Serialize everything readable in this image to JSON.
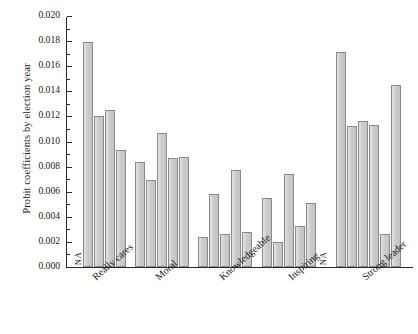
{
  "chart_data": {
    "type": "bar",
    "title": "",
    "xlabel": "",
    "ylabel": "Probit coefficients by election year",
    "ylim": [
      0.0,
      0.02
    ],
    "ytick_labels": [
      "0.000",
      "0.002",
      "0.004",
      "0.006",
      "0.008",
      "0.010",
      "0.012",
      "0.014",
      "0.016",
      "0.018",
      "0.020"
    ],
    "ytick_values": [
      0.0,
      0.002,
      0.004,
      0.006,
      0.008,
      0.01,
      0.012,
      0.014,
      0.016,
      0.018,
      0.02
    ],
    "minor_ticks": true,
    "grid": false,
    "legend": "none",
    "categories": [
      "Really cares",
      "Moral",
      "Knowledgeable",
      "Inspiring",
      "Strong leader"
    ],
    "groups": [
      {
        "name": "Really cares",
        "slots": [
          {
            "label": "NA",
            "value": null,
            "missing": true
          },
          {
            "label": "",
            "value": 0.0179
          },
          {
            "label": "",
            "value": 0.012
          },
          {
            "label": "",
            "value": 0.0125
          },
          {
            "label": "",
            "value": 0.0093
          }
        ]
      },
      {
        "name": "Moral",
        "slots": [
          {
            "label": "",
            "value": 0.0084
          },
          {
            "label": "",
            "value": 0.0069
          },
          {
            "label": "",
            "value": 0.0107
          },
          {
            "label": "",
            "value": 0.0087
          },
          {
            "label": "",
            "value": 0.0088
          }
        ]
      },
      {
        "name": "Knowledgeable",
        "slots": [
          {
            "label": "",
            "value": 0.0024
          },
          {
            "label": "",
            "value": 0.0058
          },
          {
            "label": "",
            "value": 0.0026
          },
          {
            "label": "",
            "value": 0.0077
          },
          {
            "label": "",
            "value": 0.0028
          }
        ]
      },
      {
        "name": "Inspiring",
        "slots": [
          {
            "label": "",
            "value": 0.0055
          },
          {
            "label": "",
            "value": 0.002
          },
          {
            "label": "",
            "value": 0.0074
          },
          {
            "label": "",
            "value": 0.0033
          },
          {
            "label": "",
            "value": 0.0051
          },
          {
            "label": "NA",
            "value": null,
            "missing": true
          }
        ]
      },
      {
        "name": "Strong leader",
        "slots": [
          {
            "label": "",
            "value": 0.0171
          },
          {
            "label": "",
            "value": 0.0112
          },
          {
            "label": "",
            "value": 0.0116
          },
          {
            "label": "",
            "value": 0.0113
          },
          {
            "label": "",
            "value": 0.0026
          },
          {
            "label": "",
            "value": 0.0145
          }
        ]
      }
    ]
  }
}
